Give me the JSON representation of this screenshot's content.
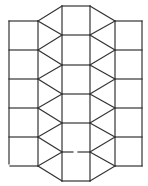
{
  "diagram": {
    "line_color": "#333333",
    "background": "#ffffff",
    "left_column_squares": 5,
    "middle_column_squares": 6,
    "right_column_squares": 5,
    "triangles_per_side": 12,
    "has_gap_in_middle_column": true
  }
}
